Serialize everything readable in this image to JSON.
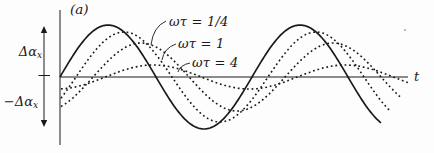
{
  "figure": {
    "panel_label": "(a)",
    "background_color": "#fdfdfd",
    "ink_color": "#1a1a1a"
  },
  "chart_data": {
    "type": "line",
    "title": "(a)",
    "xlabel": "t",
    "grid": false,
    "legend_position": "inline-annotations-with-leader-lines",
    "y_labels": {
      "upper": {
        "main": "Δα",
        "sub": "x"
      },
      "lower": {
        "main": "−Δα",
        "sub": "x"
      }
    },
    "axis_y_px": 77,
    "origin_x_px": 60,
    "period_px": 192,
    "x_axis_end_px": 408,
    "y_axis_top_px": 10,
    "y_axis_bottom_px": 145,
    "amplitude_arrow": {
      "x_px": 44,
      "top_px": 26,
      "bottom_px": 127,
      "zero_tick_y_px": 75.5
    },
    "stroke_color": "#1a1a1a",
    "series": [
      {
        "name": "driving-signal",
        "label": "",
        "style": "solid",
        "amplitude_px": 52,
        "phase_lag_deg": 0,
        "x_start_px": 60,
        "x_end_px": 381
      },
      {
        "name": "omega-tau-quarter",
        "label": "ωτ = 1/4",
        "style": "dotted",
        "amplitude_px": 45,
        "phase_lag_deg": 30,
        "x_start_px": 61,
        "x_end_px": 392
      },
      {
        "name": "omega-tau-one",
        "label": "ωτ = 1",
        "style": "dotted",
        "amplitude_px": 34,
        "phase_lag_deg": 62,
        "x_start_px": 61,
        "x_end_px": 400
      },
      {
        "name": "omega-tau-four",
        "label": "ωτ = 4",
        "style": "dotted",
        "amplitude_px": 12,
        "phase_lag_deg": 85,
        "x_start_px": 61,
        "x_end_px": 410
      }
    ],
    "annotations": [
      {
        "series": "omega-tau-quarter",
        "label_x_px": 169,
        "label_y_px": 15,
        "leader": [
          [
            166,
            21
          ],
          [
            153,
            27
          ],
          [
            151,
            45
          ]
        ]
      },
      {
        "series": "omega-tau-one",
        "label_x_px": 178,
        "label_y_px": 37,
        "leader": [
          [
            176,
            44
          ],
          [
            164,
            48
          ],
          [
            162,
            60
          ]
        ]
      },
      {
        "series": "omega-tau-four",
        "label_x_px": 192,
        "label_y_px": 56,
        "leader": [
          [
            190,
            63
          ],
          [
            180,
            65
          ],
          [
            178,
            72
          ]
        ]
      }
    ]
  }
}
